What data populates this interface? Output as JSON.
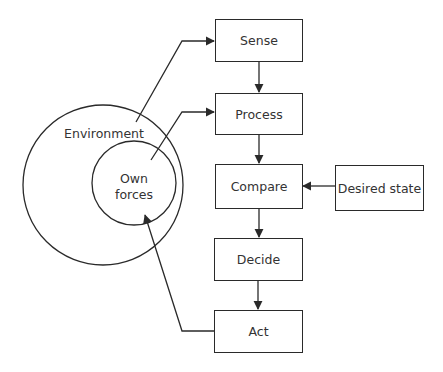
{
  "diagram": {
    "type": "control-loop",
    "circles": {
      "outer": {
        "label": "Environment"
      },
      "inner": {
        "label_line1": "Own",
        "label_line2": "forces"
      }
    },
    "boxes": {
      "sense": "Sense",
      "process": "Process",
      "compare": "Compare",
      "desired_state": "Desired state",
      "decide": "Decide",
      "act": "Act"
    },
    "edges": [
      {
        "from": "Environment",
        "to": "Sense"
      },
      {
        "from": "Own forces",
        "to": "Process"
      },
      {
        "from": "Sense",
        "to": "Process"
      },
      {
        "from": "Process",
        "to": "Compare"
      },
      {
        "from": "Desired state",
        "to": "Compare"
      },
      {
        "from": "Compare",
        "to": "Decide"
      },
      {
        "from": "Decide",
        "to": "Act"
      },
      {
        "from": "Act",
        "to": "Own forces"
      }
    ],
    "colors": {
      "stroke": "#2a2a2a",
      "text": "#333333",
      "background": "#ffffff"
    }
  }
}
